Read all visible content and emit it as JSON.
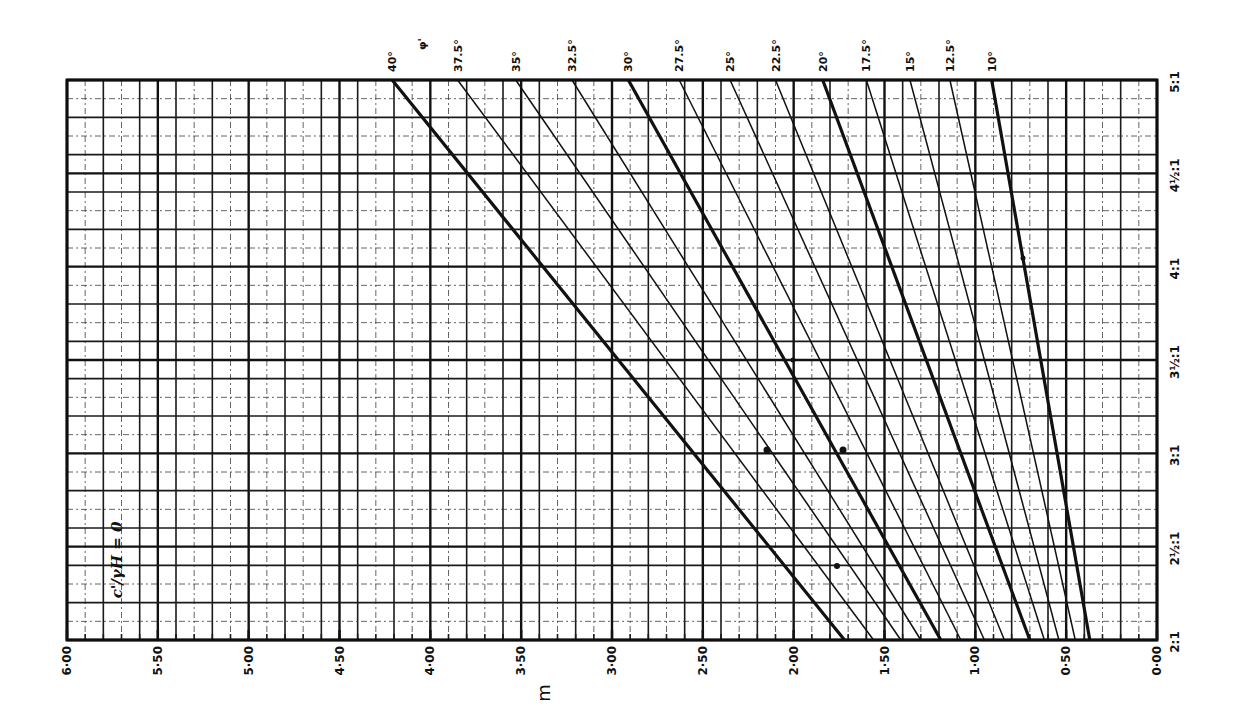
{
  "chart_data": {
    "type": "line",
    "title": "",
    "annotation": "c'/γH = 0",
    "xlabel": "m",
    "ylabel": "slope (cot β)",
    "x_ticks": [
      "6·00",
      "5·50",
      "5·00",
      "4·50",
      "4·00",
      "3·50",
      "3·00",
      "2·50",
      "2·00",
      "1·50",
      "1·00",
      "0·50",
      "0·00"
    ],
    "x_tick_values": [
      6.0,
      5.5,
      5.0,
      4.5,
      4.0,
      3.5,
      3.0,
      2.5,
      2.0,
      1.5,
      1.0,
      0.5,
      0.0
    ],
    "xlim": [
      6.0,
      0.0
    ],
    "x_reversed": true,
    "y_ticks": [
      "2:1",
      "2½:1",
      "3:1",
      "3½:1",
      "4:1",
      "4½:1",
      "5:1"
    ],
    "y_tick_values": [
      2.0,
      2.5,
      3.0,
      3.5,
      4.0,
      4.5,
      5.0
    ],
    "ylim": [
      2.0,
      5.0
    ],
    "y_axis_position": "right",
    "grid": true,
    "series_label": "φ'",
    "legend_position": "top (line end labels)",
    "series": [
      {
        "name": "40°",
        "slope": [
          2.0,
          5.0
        ],
        "m": [
          1.72,
          4.21
        ],
        "bold": true
      },
      {
        "name": "37.5°",
        "slope": [
          2.0,
          5.0
        ],
        "m": [
          1.56,
          3.85
        ],
        "bold": false
      },
      {
        "name": "35°",
        "slope": [
          2.0,
          5.0
        ],
        "m": [
          1.41,
          3.53
        ],
        "bold": false
      },
      {
        "name": "32.5°",
        "slope": [
          2.0,
          5.0
        ],
        "m": [
          1.3,
          3.22
        ],
        "bold": false
      },
      {
        "name": "30°",
        "slope": [
          2.0,
          5.0
        ],
        "m": [
          1.19,
          2.91
        ],
        "bold": true
      },
      {
        "name": "27.5°",
        "slope": [
          2.0,
          5.0
        ],
        "m": [
          1.08,
          2.63
        ],
        "bold": false
      },
      {
        "name": "25°",
        "slope": [
          2.0,
          5.0
        ],
        "m": [
          0.95,
          2.35
        ],
        "bold": false
      },
      {
        "name": "22.5°",
        "slope": [
          2.0,
          5.0
        ],
        "m": [
          0.84,
          2.1
        ],
        "bold": false
      },
      {
        "name": "20°",
        "slope": [
          2.0,
          5.0
        ],
        "m": [
          0.7,
          1.84
        ],
        "bold": true
      },
      {
        "name": "17.5°",
        "slope": [
          2.0,
          5.0
        ],
        "m": [
          0.62,
          1.6
        ],
        "bold": false
      },
      {
        "name": "15°",
        "slope": [
          2.0,
          5.0
        ],
        "m": [
          0.54,
          1.36
        ],
        "bold": false
      },
      {
        "name": "12.5°",
        "slope": [
          2.0,
          5.0
        ],
        "m": [
          0.45,
          1.14
        ],
        "bold": false
      },
      {
        "name": "10°",
        "slope": [
          2.0,
          5.0
        ],
        "m": [
          0.37,
          0.91
        ],
        "bold": true
      }
    ]
  }
}
